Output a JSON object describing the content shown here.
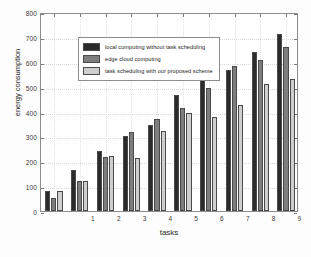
{
  "chart_data": {
    "type": "bar",
    "title": "",
    "xlabel": "tasks",
    "ylabel": "energy consumption",
    "categories": [
      "1",
      "2",
      "3",
      "4",
      "5",
      "6",
      "7",
      "8",
      "9",
      "10"
    ],
    "ylim": [
      0,
      800
    ],
    "yticks": [
      0,
      100,
      200,
      300,
      400,
      500,
      600,
      700,
      800
    ],
    "grid": true,
    "legend_position": "upper left",
    "series": [
      {
        "name": "local computing without task scheduling",
        "color": "#2b2b2b",
        "values": [
          80,
          163,
          241,
          300,
          347,
          468,
          541,
          566,
          639,
          710
        ]
      },
      {
        "name": "edge cloud computing",
        "color": "#7e7e7e",
        "values": [
          54,
          121,
          217,
          319,
          369,
          415,
          493,
          581,
          608,
          661
        ]
      },
      {
        "name": "task  scheduling with our proposed scheme",
        "color": "#cfcfcf",
        "values": [
          81,
          121,
          222,
          214,
          320,
          395,
          377,
          427,
          512,
          530
        ]
      }
    ]
  },
  "axes": {
    "ylabel": "energy consumption",
    "xlabel": "tasks"
  }
}
